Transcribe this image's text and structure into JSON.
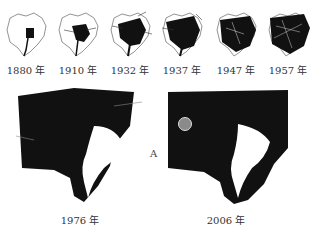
{
  "small_maps": [
    {
      "year": "1880 年",
      "density": 0.15
    },
    {
      "year": "1910 年",
      "density": 0.3
    },
    {
      "year": "1932 年",
      "density": 0.5
    },
    {
      "year": "1937 年",
      "density": 0.62
    },
    {
      "year": "1947 年",
      "density": 0.68
    },
    {
      "year": "1957 年",
      "density": 0.8
    }
  ],
  "large_maps": [
    {
      "year": "1976 年"
    },
    {
      "year": "2006 年"
    }
  ],
  "marker_label": "A",
  "colors": {
    "urban": "#111111",
    "marker": "#8a8a8a"
  }
}
